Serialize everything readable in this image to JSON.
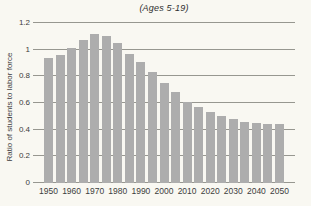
{
  "figure": {
    "title": "(Ages 5-19)"
  },
  "chart_data": {
    "type": "bar",
    "title": "(Ages 5-19)",
    "xlabel": "",
    "ylabel": "Ratio of students to labor force",
    "x": [
      1950,
      1955,
      1960,
      1965,
      1970,
      1975,
      1980,
      1985,
      1990,
      1995,
      2000,
      2005,
      2010,
      2015,
      2020,
      2025,
      2030,
      2035,
      2040,
      2045,
      2050
    ],
    "values": [
      0.94,
      0.96,
      1.01,
      1.07,
      1.12,
      1.1,
      1.05,
      0.97,
      0.91,
      0.83,
      0.75,
      0.68,
      0.61,
      0.57,
      0.53,
      0.5,
      0.48,
      0.46,
      0.45,
      0.44,
      0.44
    ],
    "x_tick_labels": [
      "1950",
      "1960",
      "1970",
      "1980",
      "1990",
      "2000",
      "2010",
      "2020",
      "2030",
      "2040",
      "2050"
    ],
    "y_ticks": [
      0,
      0.2,
      0.4,
      0.6,
      0.8,
      1,
      1.2
    ],
    "y_tick_labels": [
      "0",
      "0.2",
      "0.4",
      "0.6",
      "0.8",
      "1",
      "1.2"
    ],
    "ylim": [
      0,
      1.2
    ],
    "grid": "horizontal",
    "legend": "none",
    "bar_color": "#adadad",
    "gridline_color": "#979790",
    "background_color": "#f9f8f2"
  }
}
